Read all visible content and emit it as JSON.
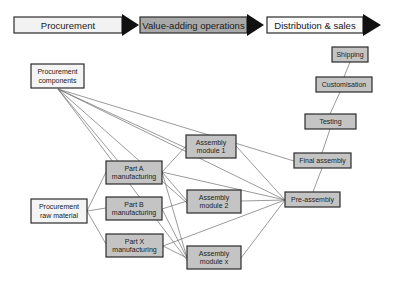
{
  "colors": {
    "box_white": "#f4f4f4",
    "box_gray": "#c4c4c4",
    "header_gray": "#a9a9a9",
    "header_white": "#f2f2f2",
    "arrow_black": "#111111",
    "edge": "#6e6e6e"
  },
  "header": {
    "stages": [
      {
        "id": "procurement",
        "label": "Procurement",
        "fill": "white"
      },
      {
        "id": "value-adding",
        "label": "Value-adding operations",
        "fill": "gray"
      },
      {
        "id": "distribution",
        "label": "Distribution & sales",
        "fill": "white"
      }
    ]
  },
  "nodes": [
    {
      "id": "proc-components",
      "lines": [
        "Procurement",
        "components"
      ],
      "fill": "white"
    },
    {
      "id": "proc-raw",
      "lines": [
        "Procurement",
        "raw material"
      ],
      "fill": "white"
    },
    {
      "id": "part-a",
      "lines": [
        "Part A",
        "manufacturing"
      ],
      "fill": "gray"
    },
    {
      "id": "part-b",
      "lines": [
        "Part B",
        "manufacturing"
      ],
      "fill": "gray"
    },
    {
      "id": "part-x",
      "lines": [
        "Part X",
        "manufacturing"
      ],
      "fill": "gray"
    },
    {
      "id": "asm-1",
      "lines": [
        "Assembly",
        "module 1"
      ],
      "fill": "gray"
    },
    {
      "id": "asm-2",
      "lines": [
        "Assembly",
        "module 2"
      ],
      "fill": "gray"
    },
    {
      "id": "asm-x",
      "lines": [
        "Assembly",
        "module x"
      ],
      "fill": "gray"
    },
    {
      "id": "pre-assembly",
      "lines": [
        "Pre-assembly"
      ],
      "fill": "gray"
    },
    {
      "id": "final-assembly",
      "lines": [
        "Final assembly"
      ],
      "fill": "gray"
    },
    {
      "id": "testing",
      "lines": [
        "Testing"
      ],
      "fill": "gray"
    },
    {
      "id": "customisation",
      "lines": [
        "Customisation"
      ],
      "fill": "gray"
    },
    {
      "id": "shipping",
      "lines": [
        "Shipping"
      ],
      "fill": "gray"
    }
  ],
  "edges": [
    [
      "proc-components",
      "asm-1"
    ],
    [
      "proc-components",
      "asm-2"
    ],
    [
      "proc-components",
      "asm-x"
    ],
    [
      "proc-components",
      "pre-assembly"
    ],
    [
      "proc-components",
      "final-assembly"
    ],
    [
      "proc-components",
      "part-a"
    ],
    [
      "proc-raw",
      "part-a"
    ],
    [
      "proc-raw",
      "part-b"
    ],
    [
      "proc-raw",
      "part-x"
    ],
    [
      "part-a",
      "asm-1"
    ],
    [
      "part-a",
      "asm-2"
    ],
    [
      "part-a",
      "asm-x"
    ],
    [
      "part-a",
      "pre-assembly"
    ],
    [
      "part-b",
      "asm-2"
    ],
    [
      "part-b",
      "asm-x"
    ],
    [
      "part-x",
      "asm-x"
    ],
    [
      "part-x",
      "pre-assembly"
    ],
    [
      "asm-1",
      "pre-assembly"
    ],
    [
      "asm-2",
      "pre-assembly"
    ],
    [
      "asm-x",
      "pre-assembly"
    ],
    [
      "pre-assembly",
      "final-assembly"
    ],
    [
      "final-assembly",
      "testing"
    ],
    [
      "testing",
      "customisation"
    ],
    [
      "customisation",
      "shipping"
    ]
  ]
}
